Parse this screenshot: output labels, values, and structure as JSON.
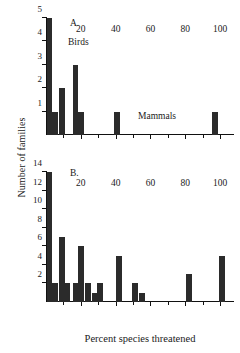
{
  "chart_data": [
    {
      "type": "bar",
      "panel": "A",
      "panel_label": "A.",
      "group_label": "Birds",
      "title": "",
      "xlabel": "",
      "ylabel": "Number of families",
      "xlim": [
        0,
        108
      ],
      "ylim": [
        0,
        5
      ],
      "xticks": [
        20,
        40,
        60,
        80,
        100
      ],
      "xticklabels": [
        "20",
        "40",
        "60",
        "80",
        "100"
      ],
      "xminorticks": [
        10,
        30,
        50,
        70,
        90
      ],
      "yticks": [
        1,
        2,
        3,
        4,
        5
      ],
      "yticklabels": [
        "1",
        "2",
        "3",
        "4",
        "5"
      ],
      "grid": false,
      "legend": "none",
      "x": [
        2,
        5,
        9,
        17,
        20,
        41,
        97
      ],
      "values": [
        5,
        1,
        2,
        3,
        1,
        1,
        1
      ],
      "bar_width": 3.3
    },
    {
      "type": "bar",
      "panel": "B",
      "panel_label": "B.",
      "group_label": "Mammals",
      "title": "",
      "xlabel": "Percent species threatened",
      "ylabel": "Number of families",
      "xlim": [
        0,
        108
      ],
      "ylim": [
        0,
        14
      ],
      "xticks": [
        20,
        40,
        60,
        80,
        100
      ],
      "xticklabels": [
        "20",
        "40",
        "60",
        "80",
        "100"
      ],
      "xminorticks": [
        10,
        30,
        50,
        70,
        90
      ],
      "yticks": [
        2,
        4,
        6,
        8,
        10,
        12,
        14
      ],
      "yticklabels": [
        "2",
        "4",
        "6",
        "8",
        "10",
        "12",
        "14"
      ],
      "grid": false,
      "legend": "none",
      "x": [
        2,
        5,
        9,
        12,
        17,
        20,
        24,
        28,
        31,
        42,
        51,
        55,
        82,
        101
      ],
      "values": [
        14,
        2,
        7,
        2,
        2,
        6,
        2,
        1,
        2,
        5,
        2,
        1,
        3,
        5
      ],
      "bar_width": 3.3
    }
  ],
  "figure": {
    "ylabel": "Number of families",
    "xlabel": "Percent species threatened",
    "bar_color": "#2b2b2b",
    "axis_color": "#111111",
    "background": "#ffffff"
  },
  "annotations": {
    "panel_a_label": "A.",
    "panel_a_group": "Birds",
    "panel_a_group2": "Mammals",
    "panel_b_label": "B."
  }
}
